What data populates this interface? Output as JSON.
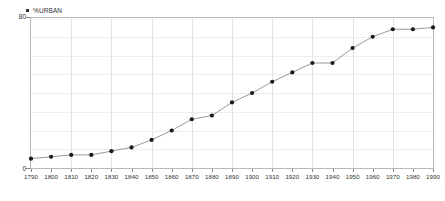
{
  "legend": {
    "marker_name": "series-marker-square",
    "label": "%URBAN",
    "position": "top-left"
  },
  "axis": {
    "y_top_label": "80",
    "y_bottom_label": "0",
    "x_tick_labels": [
      "1790",
      "1800",
      "1810",
      "1820",
      "1830",
      "1840",
      "1850",
      "1860",
      "1870",
      "1880",
      "1890",
      "1900",
      "1910",
      "1920",
      "1930",
      "1940",
      "1950",
      "1960",
      "1970",
      "1980",
      "1990"
    ]
  },
  "colors": {
    "line": "#8d8d8d",
    "marker": "#1a1a1a",
    "frame": "#b9b9b9",
    "grid_vertical": "#e3e3e3",
    "grid_horizontal": "#ededed",
    "text": "#333333",
    "background": "#ffffff"
  },
  "chart_data": {
    "type": "line",
    "title": "",
    "subtitle": "",
    "xlabel": "",
    "ylabel": "",
    "xlim": [
      1790,
      1990
    ],
    "ylim": [
      0,
      80
    ],
    "grid": true,
    "legend_position": "top-left",
    "markers": true,
    "x": [
      1790,
      1800,
      1810,
      1820,
      1830,
      1840,
      1850,
      1860,
      1870,
      1880,
      1890,
      1900,
      1910,
      1920,
      1930,
      1940,
      1950,
      1960,
      1970,
      1980,
      1990
    ],
    "series": [
      {
        "name": "%URBAN",
        "values": [
          5,
          6,
          7,
          7,
          9,
          11,
          15,
          20,
          26,
          28,
          35,
          40,
          46,
          51,
          56,
          56,
          64,
          70,
          74,
          74,
          75
        ]
      }
    ]
  }
}
